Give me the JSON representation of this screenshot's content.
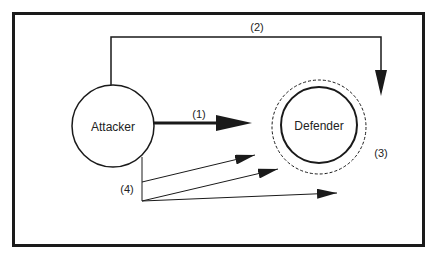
{
  "diagram": {
    "nodes": {
      "attacker": {
        "label": "Attacker"
      },
      "defender": {
        "label": "Defender"
      }
    },
    "labels": {
      "direct_attack": "(1)",
      "indirect_attack": "(2)",
      "defense_perimeter": "(3)",
      "multiple_attacks": "(4)"
    },
    "colors": {
      "stroke": "#1a1a1a",
      "background": "#ffffff"
    }
  }
}
